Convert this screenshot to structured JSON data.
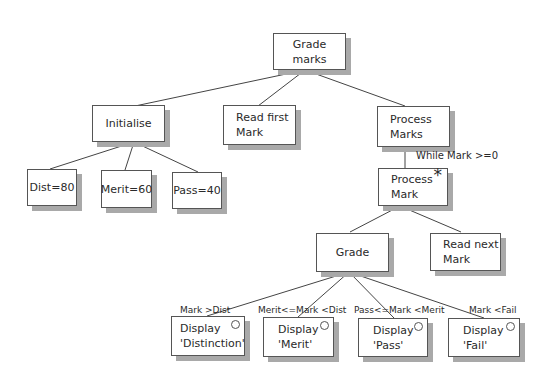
{
  "diagram": {
    "type": "Jackson structure diagram",
    "nodes": {
      "root": {
        "label": "Grade marks"
      },
      "initialise": {
        "label": "Initialise"
      },
      "read_first": {
        "line1": "Read first",
        "line2": "Mark"
      },
      "process_marks": {
        "line1": "Process",
        "line2": "Marks"
      },
      "dist": {
        "label": "Dist=80"
      },
      "merit": {
        "label": "Merit=60"
      },
      "pass": {
        "label": "Pass=40"
      },
      "process_mark": {
        "line1": "Process",
        "line2": "Mark",
        "marker": "*"
      },
      "grade": {
        "label": "Grade"
      },
      "read_next": {
        "line1": "Read next",
        "line2": "Mark"
      },
      "display_distinction": {
        "line1": "Display",
        "line2": "'Distinction'"
      },
      "display_merit": {
        "line1": "Display",
        "line2": "'Merit'"
      },
      "display_pass": {
        "line1": "Display",
        "line2": "'Pass'"
      },
      "display_fail": {
        "line1": "Display",
        "line2": "'Fail'"
      }
    },
    "conditions": {
      "while": "While Mark >=0",
      "distinction": "Mark >Dist",
      "merit": "Merit<=Mark <Dist",
      "pass": "Pass<=Mark <Merit",
      "fail": "Mark <Fail"
    },
    "colors": {
      "border": "#555555",
      "shadow": "#a9a9a9",
      "line": "#444444"
    }
  }
}
